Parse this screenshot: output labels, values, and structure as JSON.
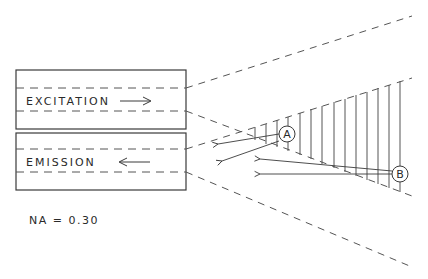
{
  "diagram": {
    "fibers": [
      {
        "label": "EXCITATION",
        "direction": "right",
        "arrow_glyph": "→"
      },
      {
        "label": "EMISSION",
        "direction": "left",
        "arrow_glyph": "←"
      }
    ],
    "annotation": {
      "na_label": "NA = 0.30"
    },
    "regions": [
      {
        "label": "A"
      },
      {
        "label": "B"
      }
    ],
    "colors": {
      "line": "#3a3a3a",
      "background": "#ffffff"
    }
  }
}
